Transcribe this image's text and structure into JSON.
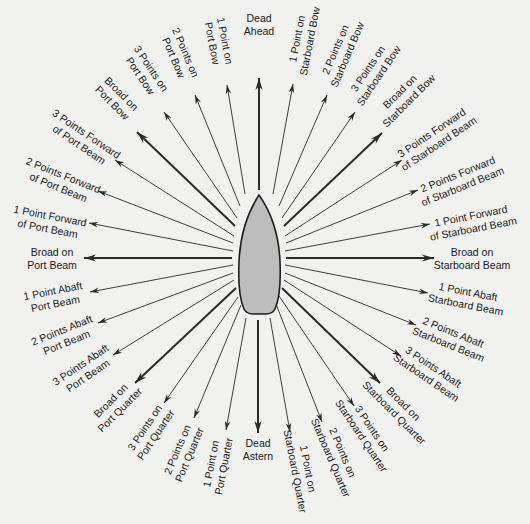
{
  "diagram": {
    "center": [
      259,
      258
    ],
    "ship": {
      "fill": "#bdbdbd",
      "stroke": "#1e1e1e"
    },
    "line_color": "#2a2a2a",
    "bearings": [
      {
        "id": "dead-ahead",
        "lines": [
          "Dead",
          "Ahead"
        ],
        "tip": [
          259,
          78
        ],
        "start": [
          259,
          190
        ],
        "bold": true,
        "label": [
          259,
          24
        ],
        "rot": 0
      },
      {
        "id": "1-point-on-starboard-bow",
        "lines": [
          "1 Point on",
          "Starboard Bow"
        ],
        "tip": [
          293,
          84
        ],
        "start": [
          273,
          194
        ],
        "bold": false,
        "label": [
          303,
          40
        ],
        "rot": -79
      },
      {
        "id": "2-points-on-starboard-bow",
        "lines": [
          "2 Points on",
          "Starboard Bow"
        ],
        "tip": [
          327,
          95
        ],
        "start": [
          279,
          206
        ],
        "bold": false,
        "label": [
          341,
          52
        ],
        "rot": -67
      },
      {
        "id": "3-points-on-starboard-bow",
        "lines": [
          "3 Points on",
          "Starboard Bow"
        ],
        "tip": [
          355,
          112
        ],
        "start": [
          282,
          218
        ],
        "bold": false,
        "label": [
          373,
          72
        ],
        "rot": -56
      },
      {
        "id": "broad-on-starboard-bow",
        "lines": [
          "Broad on",
          "Starboard Bow"
        ],
        "tip": [
          382,
          133
        ],
        "start": [
          284,
          226
        ],
        "bold": true,
        "label": [
          404,
          96
        ],
        "rot": -45
      },
      {
        "id": "3-points-forward-of-starboard-beam",
        "lines": [
          "3 Points Forward",
          "of Starboard Beam"
        ],
        "tip": [
          402,
          160
        ],
        "start": [
          285,
          236
        ],
        "bold": false,
        "label": [
          435,
          138
        ],
        "rot": -34
      },
      {
        "id": "2-points-forward-of-starboard-beam",
        "lines": [
          "2 Points Forward",
          "of Starboard Beam"
        ],
        "tip": [
          418,
          190
        ],
        "start": [
          286,
          243
        ],
        "bold": false,
        "label": [
          460,
          180
        ],
        "rot": -22
      },
      {
        "id": "1-point-forward-of-starboard-beam",
        "lines": [
          "1 Point Forward",
          "of Starboard Beam"
        ],
        "tip": [
          430,
          224
        ],
        "start": [
          285,
          251
        ],
        "bold": false,
        "label": [
          472,
          222
        ],
        "rot": -11
      },
      {
        "id": "broad-on-starboard-beam",
        "lines": [
          "Broad on",
          "Starboard Beam"
        ],
        "tip": [
          434,
          258
        ],
        "start": [
          286,
          258
        ],
        "bold": true,
        "label": [
          472,
          258
        ],
        "rot": 0
      },
      {
        "id": "1-point-abaft-starboard-beam",
        "lines": [
          "1 Point Abaft",
          "Starboard Beam"
        ],
        "tip": [
          428,
          293
        ],
        "start": [
          285,
          265
        ],
        "bold": false,
        "label": [
          467,
          298
        ],
        "rot": 11
      },
      {
        "id": "2-points-abaft-starboard-beam",
        "lines": [
          "2 Points Abaft",
          "Starboard Beam"
        ],
        "tip": [
          416,
          325
        ],
        "start": [
          285,
          273
        ],
        "bold": false,
        "label": [
          451,
          338
        ],
        "rot": 22
      },
      {
        "id": "3-points-abaft-starboard-beam",
        "lines": [
          "3 Points Abaft",
          "Starboard Beam"
        ],
        "tip": [
          401,
          356
        ],
        "start": [
          284,
          280
        ],
        "bold": false,
        "label": [
          430,
          372
        ],
        "rot": 34
      },
      {
        "id": "broad-on-starboard-quarter",
        "lines": [
          "Broad on",
          "Starboard Quarter"
        ],
        "tip": [
          380,
          383
        ],
        "start": [
          282,
          288
        ],
        "bold": true,
        "label": [
          399,
          408
        ],
        "rot": 45
      },
      {
        "id": "3-points-on-starboard-quarter",
        "lines": [
          "3 Points on",
          "Starboard Quarter"
        ],
        "tip": [
          354,
          406
        ],
        "start": [
          279,
          296
        ],
        "bold": false,
        "label": [
          367,
          432
        ],
        "rot": 56
      },
      {
        "id": "2-points-on-starboard-quarter",
        "lines": [
          "2 Points on",
          "Starboard Quarter"
        ],
        "tip": [
          322,
          422
        ],
        "start": [
          276,
          304
        ],
        "bold": false,
        "label": [
          337,
          455
        ],
        "rot": 67
      },
      {
        "id": "1-point-on-starboard-quarter",
        "lines": [
          "1 Point on",
          "Starboard Quarter"
        ],
        "tip": [
          290,
          432
        ],
        "start": [
          270,
          318
        ],
        "bold": false,
        "label": [
          302,
          470
        ],
        "rot": 79
      },
      {
        "id": "dead-astern",
        "lines": [
          "Dead",
          "Astern"
        ],
        "tip": [
          258,
          433
        ],
        "start": [
          258,
          320
        ],
        "bold": true,
        "label": [
          258,
          449
        ],
        "rot": 0
      },
      {
        "id": "1-point-on-port-quarter",
        "lines": [
          "1 Point on",
          "Port Quarter"
        ],
        "tip": [
          226,
          430
        ],
        "start": [
          246,
          318
        ],
        "bold": false,
        "label": [
          217,
          465
        ],
        "rot": -79
      },
      {
        "id": "2-points-on-port-quarter",
        "lines": [
          "2 Points on",
          "Port Quarter"
        ],
        "tip": [
          194,
          418
        ],
        "start": [
          241,
          305
        ],
        "bold": false,
        "label": [
          183,
          452
        ],
        "rot": -67
      },
      {
        "id": "3-points-on-port-quarter",
        "lines": [
          "3 Points on",
          "Port Quarter"
        ],
        "tip": [
          164,
          403
        ],
        "start": [
          238,
          297
        ],
        "bold": false,
        "label": [
          150,
          431
        ],
        "rot": -56
      },
      {
        "id": "broad-on-port-quarter",
        "lines": [
          "Broad on",
          "Port Quarter"
        ],
        "tip": [
          135,
          383
        ],
        "start": [
          236,
          288
        ],
        "bold": true,
        "label": [
          115,
          405
        ],
        "rot": -45
      },
      {
        "id": "3-points-abaft-port-beam",
        "lines": [
          "3 Points Abaft",
          "Port Beam"
        ],
        "tip": [
          113,
          355
        ],
        "start": [
          234,
          280
        ],
        "bold": false,
        "label": [
          84,
          370
        ],
        "rot": -34
      },
      {
        "id": "2-points-abaft-port-beam",
        "lines": [
          "2 Points Abaft",
          "Port Beam"
        ],
        "tip": [
          98,
          323
        ],
        "start": [
          233,
          273
        ],
        "bold": false,
        "label": [
          64,
          336
        ],
        "rot": -22
      },
      {
        "id": "1-point-abaft-port-beam",
        "lines": [
          "1 Point Abaft",
          "Port Beam"
        ],
        "tip": [
          90,
          292
        ],
        "start": [
          233,
          265
        ],
        "bold": false,
        "label": [
          54,
          297
        ],
        "rot": -11
      },
      {
        "id": "broad-on-port-beam",
        "lines": [
          "Broad on",
          "Port Beam"
        ],
        "tip": [
          84,
          258
        ],
        "start": [
          232,
          258
        ],
        "bold": true,
        "label": [
          52,
          258
        ],
        "rot": 0
      },
      {
        "id": "1-point-forward-of-port-beam",
        "lines": [
          "1 Point Forward",
          "of Port Beam"
        ],
        "tip": [
          89,
          223
        ],
        "start": [
          233,
          251
        ],
        "bold": false,
        "label": [
          49,
          222
        ],
        "rot": 11
      },
      {
        "id": "2-points-forward-of-port-beam",
        "lines": [
          "2 Points Forward",
          "of Port Beam"
        ],
        "tip": [
          98,
          191
        ],
        "start": [
          233,
          243
        ],
        "bold": false,
        "label": [
          61,
          181
        ],
        "rot": 22
      },
      {
        "id": "3-points-forward-of-port-beam",
        "lines": [
          "3 Points Forward",
          "of Port Beam"
        ],
        "tip": [
          115,
          160
        ],
        "start": [
          234,
          236
        ],
        "bold": false,
        "label": [
          83,
          139
        ],
        "rot": 34
      },
      {
        "id": "broad-on-port-bow",
        "lines": [
          "Broad on",
          "Port Bow"
        ],
        "tip": [
          137,
          132
        ],
        "start": [
          235,
          226
        ],
        "bold": true,
        "label": [
          117,
          98
        ],
        "rot": 45
      },
      {
        "id": "3-points-on-port-bow",
        "lines": [
          "3 Points on",
          "Port Bow"
        ],
        "tip": [
          164,
          112
        ],
        "start": [
          237,
          218
        ],
        "bold": false,
        "label": [
          146,
          72
        ],
        "rot": 56
      },
      {
        "id": "2-points-on-port-bow",
        "lines": [
          "2 Points on",
          "Port Bow"
        ],
        "tip": [
          195,
          95
        ],
        "start": [
          240,
          206
        ],
        "bold": false,
        "label": [
          180,
          55
        ],
        "rot": 67
      },
      {
        "id": "1-point-on-port-bow",
        "lines": [
          "1 Point on",
          "Port Bow"
        ],
        "tip": [
          227,
          85
        ],
        "start": [
          245,
          194
        ],
        "bold": false,
        "label": [
          219,
          42
        ],
        "rot": 79
      }
    ]
  }
}
